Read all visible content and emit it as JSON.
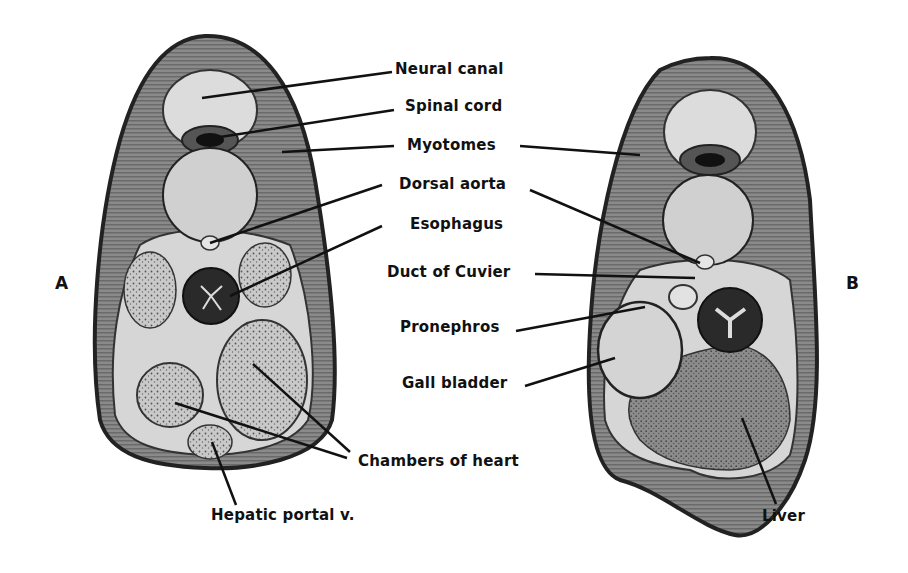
{
  "figure": {
    "panels": [
      {
        "id": "A",
        "label": "A"
      },
      {
        "id": "B",
        "label": "B"
      }
    ],
    "labels": {
      "neural_canal": "Neural canal",
      "spinal_cord": "Spinal cord",
      "myotomes": "Myotomes",
      "dorsal_aorta": "Dorsal aorta",
      "esophagus": "Esophagus",
      "duct_of_cuvier": "Duct of Cuvier",
      "pronephros": "Pronephros",
      "gall_bladder": "Gall bladder",
      "chambers_of_heart": "Chambers of heart",
      "hepatic_portal": "Hepatic portal v.",
      "liver": "Liver"
    },
    "colors": {
      "background": "#ffffff",
      "outline": "#222222",
      "muscle": "#7a7a7a",
      "light_tissue": "#d8d8d8",
      "dark_tissue": "#2a2a2a",
      "label_text": "#111111"
    }
  }
}
